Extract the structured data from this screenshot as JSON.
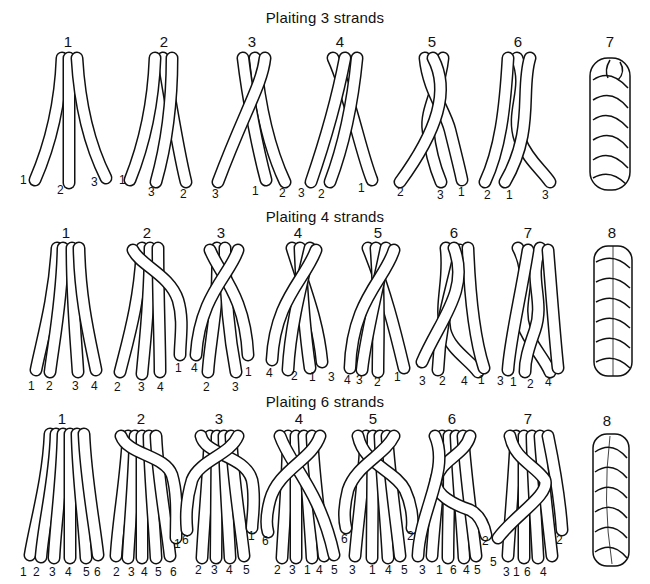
{
  "sections": [
    {
      "title": "Plaiting 3 strands",
      "steps": [
        {
          "num": "1",
          "labels": [
            "1",
            "2",
            "3"
          ]
        },
        {
          "num": "2",
          "labels": [
            "1",
            "3",
            "2"
          ]
        },
        {
          "num": "3",
          "labels": [
            "3",
            "1",
            "2"
          ]
        },
        {
          "num": "4",
          "labels": [
            "3",
            "2",
            "1"
          ]
        },
        {
          "num": "5",
          "labels": [
            "2",
            "3",
            "1"
          ]
        },
        {
          "num": "6",
          "labels": [
            "2",
            "1",
            "3"
          ]
        },
        {
          "num": "7",
          "labels": []
        }
      ]
    },
    {
      "title": "Plaiting 4 strands",
      "steps": [
        {
          "num": "1",
          "labels": [
            "1",
            "2",
            "3",
            "4"
          ]
        },
        {
          "num": "2",
          "labels": [
            "2",
            "3",
            "4",
            "1"
          ]
        },
        {
          "num": "3",
          "labels": [
            "4",
            "2",
            "3",
            "1"
          ]
        },
        {
          "num": "4",
          "labels": [
            "4",
            "2",
            "1",
            "3"
          ]
        },
        {
          "num": "5",
          "labels": [
            "4",
            "3",
            "2",
            "1"
          ]
        },
        {
          "num": "6",
          "labels": [
            "3",
            "2",
            "4",
            "1"
          ]
        },
        {
          "num": "7",
          "labels": [
            "3",
            "1",
            "2",
            "4"
          ]
        },
        {
          "num": "8",
          "labels": []
        }
      ]
    },
    {
      "title": "Plaiting 6 strands",
      "steps": [
        {
          "num": "1",
          "labels": [
            "1",
            "2",
            "3",
            "4",
            "5",
            "6"
          ]
        },
        {
          "num": "2",
          "labels": [
            "2",
            "3",
            "4",
            "5",
            "6",
            "1"
          ]
        },
        {
          "num": "3",
          "labels": [
            "6",
            "2",
            "3",
            "4",
            "5",
            "1"
          ]
        },
        {
          "num": "4",
          "labels": [
            "6",
            "2",
            "3",
            "1",
            "4",
            "5"
          ]
        },
        {
          "num": "5",
          "labels": [
            "6",
            "3",
            "1",
            "4",
            "5",
            "2"
          ]
        },
        {
          "num": "6",
          "labels": [
            "3",
            "1",
            "6",
            "4",
            "5",
            "2"
          ]
        },
        {
          "num": "7",
          "labels": [
            "5",
            "3",
            "1",
            "6",
            "4",
            "2"
          ]
        },
        {
          "num": "8",
          "labels": []
        }
      ]
    }
  ]
}
